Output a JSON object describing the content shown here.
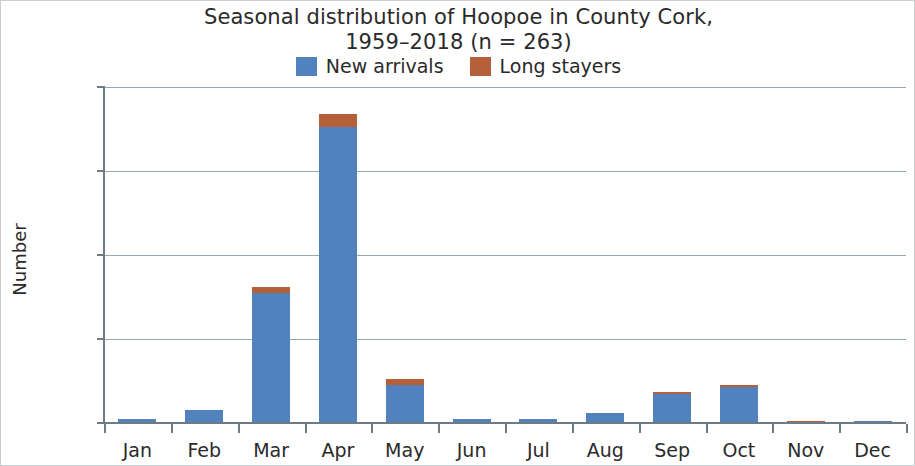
{
  "chart_data": {
    "type": "bar",
    "title": "Seasonal distribution of Hoopoe in County Cork, 1959–2018 (n = 263)",
    "title_lines": [
      "Seasonal distribution of Hoopoe in County Cork,",
      "1959–2018 (n = 263)"
    ],
    "xlabel": "",
    "ylabel": "Number",
    "ylim": [
      0,
      160
    ],
    "yticks": [
      0,
      40,
      80,
      120,
      160
    ],
    "ytick_labels": [
      "0",
      "40",
      "80",
      "120",
      "160"
    ],
    "grid": true,
    "stacked": true,
    "legend_position": "top-center",
    "categories": [
      "Jan",
      "Feb",
      "Mar",
      "Apr",
      "May",
      "Jun",
      "Jul",
      "Aug",
      "Sep",
      "Oct",
      "Nov",
      "Dec"
    ],
    "series": [
      {
        "name": "New arrivals",
        "color": "#5282BE",
        "values": [
          2,
          6,
          62,
          141,
          18,
          2,
          2,
          5,
          14,
          17,
          0,
          1
        ]
      },
      {
        "name": "Long stayers",
        "color": "#B5603A",
        "values": [
          0,
          0,
          3,
          6,
          3,
          0,
          0,
          0,
          1,
          1,
          1,
          0
        ]
      }
    ],
    "totals": [
      2,
      6,
      65,
      147,
      21,
      2,
      2,
      5,
      15,
      18,
      1,
      1
    ]
  },
  "legend": {
    "items": [
      {
        "label": "New arrivals",
        "color": "#5282BE",
        "swatch_name": "legend-swatch-new-arrivals"
      },
      {
        "label": "Long stayers",
        "color": "#B5603A",
        "swatch_name": "legend-swatch-long-stayers"
      }
    ]
  },
  "axes": {
    "y_title": "Number"
  }
}
